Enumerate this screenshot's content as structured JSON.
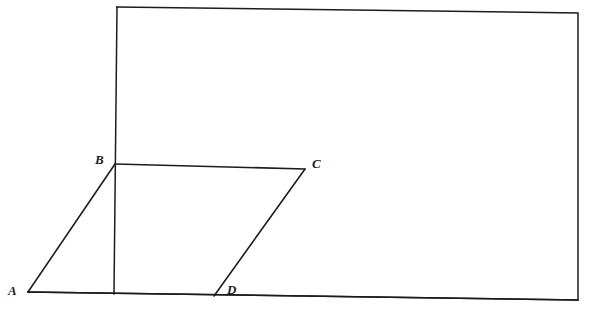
{
  "figure": {
    "kind": "geometry-diagram",
    "background_color": "#ffffff",
    "stroke_color": "#1c1c1c",
    "stroke_width": 1.5,
    "canvas": {
      "width": 590,
      "height": 313
    },
    "frame": {
      "name": "outer-rectangle",
      "points": "117,7 578,13 578,300 28,292",
      "corners": {
        "top_left": {
          "x": 117,
          "y": 7
        },
        "top_right": {
          "x": 578,
          "y": 13
        },
        "bottom_right": {
          "x": 578,
          "y": 300
        },
        "bottom_left": {
          "x": 28,
          "y": 292
        }
      }
    },
    "left_edge": {
      "name": "frame-left-edge",
      "x1": 117,
      "y1": 7,
      "x2": 114,
      "y2": 294
    },
    "parallelogram": {
      "name": "parallelogram-abcd",
      "points": "28,292 115,164 305,169 214,296",
      "vertices": [
        {
          "id": "A",
          "label": "A",
          "x": 28,
          "y": 292,
          "label_x": 8,
          "label_y": 284
        },
        {
          "id": "B",
          "label": "B",
          "x": 115,
          "y": 164,
          "label_x": 95,
          "label_y": 153
        },
        {
          "id": "C",
          "label": "C",
          "x": 305,
          "y": 169,
          "label_x": 312,
          "label_y": 157
        },
        {
          "id": "D",
          "label": "D",
          "x": 214,
          "y": 296,
          "label_x": 227,
          "label_y": 283
        }
      ],
      "edges": [
        {
          "name": "edge-ab",
          "from": "A",
          "to": "B",
          "x1": 28,
          "y1": 292,
          "x2": 115,
          "y2": 164
        },
        {
          "name": "edge-bc",
          "from": "B",
          "to": "C",
          "x1": 115,
          "y1": 164,
          "x2": 305,
          "y2": 169
        },
        {
          "name": "edge-cd",
          "from": "C",
          "to": "D",
          "x1": 305,
          "y1": 169,
          "x2": 214,
          "y2": 296
        },
        {
          "name": "edge-da",
          "from": "D",
          "to": "A",
          "x1": 214,
          "y1": 296,
          "x2": 28,
          "y2": 292
        }
      ]
    },
    "bottom_edge": {
      "name": "frame-bottom-edge",
      "x1": 28,
      "y1": 292,
      "x2": 578,
      "y2": 300
    }
  }
}
